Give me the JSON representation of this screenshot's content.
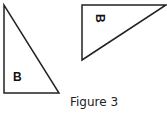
{
  "figure": {
    "caption": "Figure 3",
    "shapes": [
      {
        "name": "left-triangle",
        "label": "B",
        "points": "4,5 4,93 59,93",
        "label_x": 13,
        "label_y": 81,
        "rotation": 0
      },
      {
        "name": "right-triangle",
        "label": "B",
        "points": "82,5 166,5 82,60",
        "label_x": 96,
        "label_y": 18,
        "rotation": 90
      }
    ],
    "stroke_color": "#222222",
    "fill_color": "#ffffff"
  }
}
